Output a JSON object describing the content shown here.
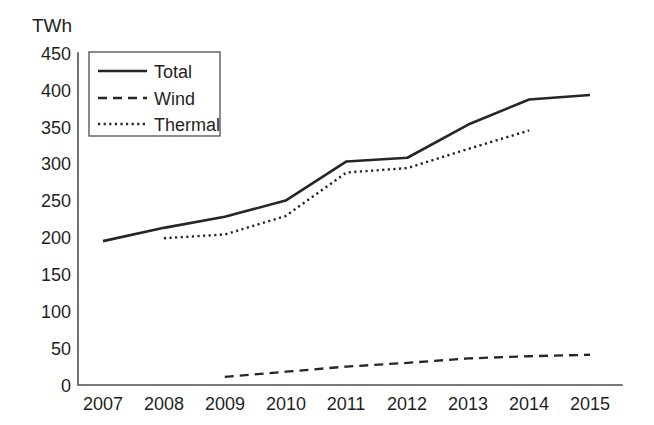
{
  "chart_data": {
    "type": "line",
    "title": "",
    "subtitle": "",
    "xlabel": "",
    "ylabel": "TWh",
    "unit_label": "TWh",
    "categories": [
      "2007",
      "2008",
      "2009",
      "2010",
      "2011",
      "2012",
      "2013",
      "2014",
      "2015"
    ],
    "x": [
      2007,
      2008,
      2009,
      2010,
      2011,
      2012,
      2013,
      2014,
      2015
    ],
    "ylim": [
      0,
      450
    ],
    "ytick_step": 50,
    "yticks": [
      "450",
      "400",
      "350",
      "300",
      "250",
      "200",
      "150",
      "100",
      "50",
      "0"
    ],
    "ytick_values": [
      450,
      400,
      350,
      300,
      250,
      200,
      150,
      100,
      50,
      0
    ],
    "grid": false,
    "legend_position": "top-left",
    "series": [
      {
        "name": "Total",
        "style": "solid",
        "color": "#262626",
        "values": [
          195,
          213,
          228,
          250,
          303,
          308,
          353,
          387,
          393
        ]
      },
      {
        "name": "Wind",
        "style": "dashed",
        "color": "#262626",
        "values": [
          null,
          null,
          11,
          18,
          25,
          30,
          36,
          39,
          41
        ]
      },
      {
        "name": "Thermal",
        "style": "dotted",
        "color": "#262626",
        "values": [
          null,
          199,
          204,
          229,
          288,
          294,
          320,
          345,
          null
        ]
      }
    ]
  },
  "legend": {
    "items": [
      {
        "label": "Total",
        "style": "solid"
      },
      {
        "label": "Wind",
        "style": "dashed"
      },
      {
        "label": "Thermal",
        "style": "dotted"
      }
    ]
  },
  "colors": {
    "line": "#262626",
    "axis": "#4d4d4d",
    "background": "#ffffff",
    "text": "#1f1f1f"
  }
}
